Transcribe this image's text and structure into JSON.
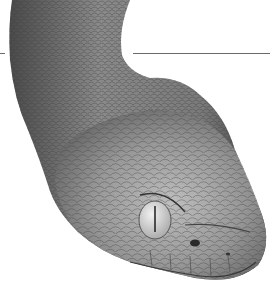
{
  "image": {
    "subject": "snake-head-illustration",
    "style": "grayscale pencil drawing",
    "colors": {
      "background": "#ffffff",
      "body_dark": "#4a4a4a",
      "body_mid": "#8a8a8a",
      "body_light": "#c4c4c4",
      "eye": "#d8d8d8",
      "pupil": "#2a2a2a",
      "rule_line": "#6a6a6a"
    }
  }
}
